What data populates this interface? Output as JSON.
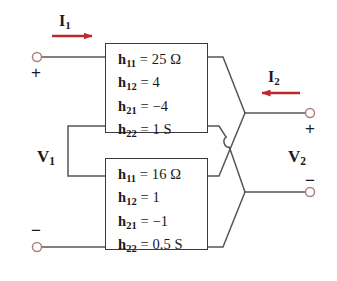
{
  "figure": {
    "stroke_color": "#555555",
    "arrow_color": "#c0272d",
    "terminal_color": "#b08080",
    "box_border_color": "#3a3a3a",
    "text_color": "#1a1a1a"
  },
  "networks": [
    {
      "id": "top-network",
      "position": "top",
      "parameters": [
        {
          "name": "h",
          "subscript": "11",
          "relation": "=",
          "value": "25 Ω"
        },
        {
          "name": "h",
          "subscript": "12",
          "relation": "=",
          "value": "4"
        },
        {
          "name": "h",
          "subscript": "21",
          "relation": "=",
          "value": "−4"
        },
        {
          "name": "h",
          "subscript": "22",
          "relation": "=",
          "value": "1 S"
        }
      ]
    },
    {
      "id": "bottom-network",
      "position": "bottom",
      "parameters": [
        {
          "name": "h",
          "subscript": "11",
          "relation": "=",
          "value": "16 Ω"
        },
        {
          "name": "h",
          "subscript": "12",
          "relation": "=",
          "value": "1"
        },
        {
          "name": "h",
          "subscript": "21",
          "relation": "=",
          "value": "−1"
        },
        {
          "name": "h",
          "subscript": "22",
          "relation": "=",
          "value": "0.5 S"
        }
      ]
    }
  ],
  "labels": {
    "current_input": {
      "symbol": "I",
      "subscript": "1"
    },
    "current_output": {
      "symbol": "I",
      "subscript": "2"
    },
    "voltage_input": {
      "symbol": "V",
      "subscript": "1"
    },
    "voltage_output": {
      "symbol": "V",
      "subscript": "2"
    },
    "plus_left": "+",
    "minus_left": "−",
    "plus_right": "+",
    "minus_right": "−"
  },
  "arrows": {
    "input_current_direction": "right",
    "output_current_direction": "left"
  },
  "terminals": [
    {
      "id": "input-positive",
      "x": 37,
      "y": 57,
      "sign": "+"
    },
    {
      "id": "input-negative",
      "x": 37,
      "y": 247,
      "sign": "−"
    },
    {
      "id": "output-positive",
      "x": 310,
      "y": 113,
      "sign": "+"
    },
    {
      "id": "output-negative",
      "x": 310,
      "y": 192,
      "sign": "−"
    }
  ]
}
